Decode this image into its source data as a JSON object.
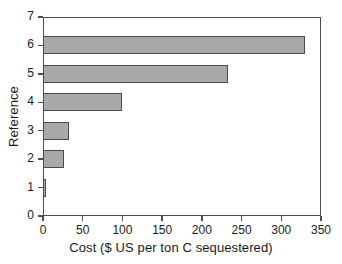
{
  "chart_data": {
    "type": "bar",
    "orientation": "horizontal",
    "title": "",
    "xlabel": "Cost ($ US per ton C sequestered)",
    "ylabel": "Reference",
    "categories": [
      "1",
      "2",
      "3",
      "4",
      "5",
      "6"
    ],
    "values": [
      4,
      26,
      33,
      100,
      233,
      330
    ],
    "xlim": [
      0,
      350
    ],
    "ylim": [
      0,
      7
    ],
    "xticks": [
      0,
      50,
      100,
      150,
      200,
      250,
      300,
      350
    ],
    "yticks": [
      0,
      1,
      2,
      3,
      4,
      5,
      6,
      7
    ],
    "xticklabels": [
      "0",
      "50",
      "100",
      "150",
      "200",
      "250",
      "300",
      "350"
    ],
    "yticklabels": [
      "0",
      "1",
      "2",
      "3",
      "4",
      "5",
      "6",
      "7"
    ],
    "grid": false,
    "legend": null,
    "bar_fill_color": "#a9a9a9",
    "bar_edge_color": "#4a4a4a",
    "axis_color": "#4d4d4d",
    "background_color": "#ffffff",
    "bar_thickness_units": 0.63
  }
}
